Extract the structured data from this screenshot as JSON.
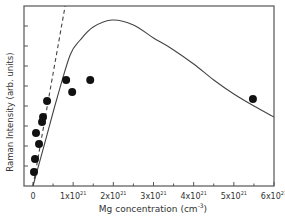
{
  "chart_data": {
    "type": "scatter",
    "title": "",
    "xlabel": "Mg concentration (cm",
    "xlabel_sup": "-3",
    "xlabel_suffix": ")",
    "ylabel": "Raman Intensity (arb. units)",
    "xlim": [
      0,
      6
    ],
    "x_unit_exponent": 21,
    "ylim": [
      0,
      9
    ],
    "x_ticks": [
      {
        "value": 0,
        "label": "0",
        "sup": ""
      },
      {
        "value": 1,
        "label": "1x10",
        "sup": "21"
      },
      {
        "value": 2,
        "label": "2x10",
        "sup": "21"
      },
      {
        "value": 3,
        "label": "3x10",
        "sup": "21"
      },
      {
        "value": 4,
        "label": "4x10",
        "sup": "21"
      },
      {
        "value": 5,
        "label": "5x10",
        "sup": "21"
      },
      {
        "value": 6,
        "label": "6x10",
        "sup": "21"
      }
    ],
    "y_ticks": [
      1,
      2,
      3,
      4,
      5,
      6,
      7,
      8
    ],
    "grid": false,
    "legend": null,
    "series": [
      {
        "name": "measured",
        "kind": "scatter",
        "marker": "filled-circle",
        "color": "#111111",
        "points": [
          [
            0.025,
            0.7
          ],
          [
            0.05,
            1.35
          ],
          [
            0.15,
            2.1
          ],
          [
            0.075,
            2.65
          ],
          [
            0.225,
            3.2
          ],
          [
            0.25,
            3.45
          ],
          [
            0.35,
            4.25
          ],
          [
            0.825,
            5.3
          ],
          [
            0.975,
            4.7
          ],
          [
            1.425,
            5.3
          ],
          [
            5.475,
            4.35
          ]
        ]
      },
      {
        "name": "model-fit",
        "kind": "line",
        "style": "solid",
        "color": "#444444",
        "points": [
          [
            0.0,
            0.0
          ],
          [
            0.3,
            2.2
          ],
          [
            0.6,
            4.4
          ],
          [
            0.925,
            6.55
          ],
          [
            1.175,
            7.3
          ],
          [
            1.5,
            7.95
          ],
          [
            1.975,
            8.3
          ],
          [
            2.5,
            8.05
          ],
          [
            3.0,
            7.4
          ],
          [
            3.425,
            6.9
          ],
          [
            4.0,
            6.1
          ],
          [
            4.5,
            5.3
          ],
          [
            5.0,
            4.6
          ],
          [
            5.5,
            4.0
          ],
          [
            6.0,
            3.45
          ]
        ]
      },
      {
        "name": "linear-dashed",
        "kind": "line",
        "style": "dashed",
        "color": "#444444",
        "points": [
          [
            0.0,
            0.0
          ],
          [
            0.8,
            9.0
          ]
        ]
      }
    ]
  }
}
